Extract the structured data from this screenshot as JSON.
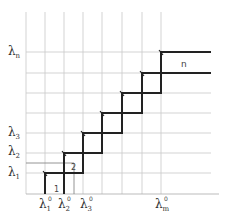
{
  "diagram": {
    "type": "staircase-grid",
    "grid": {
      "vertical_x": [
        26,
        45,
        64,
        83,
        102,
        122,
        142,
        161
      ],
      "horizontal_y": [
        52,
        73,
        93,
        113,
        133,
        153,
        173,
        193
      ],
      "top": 12,
      "bottom": 194,
      "left": 26,
      "right": 211,
      "color": "#c8c8c8"
    },
    "y_labels": [
      {
        "base": "λ",
        "sub": "1",
        "y": 173
      },
      {
        "base": "λ",
        "sub": "2",
        "y": 153
      },
      {
        "base": "λ",
        "sub": "3",
        "y": 133
      },
      {
        "base": "λ",
        "sub": "n",
        "y": 52
      }
    ],
    "x_labels": [
      {
        "base": "λ",
        "sup": "0",
        "sub": "1",
        "x": 45
      },
      {
        "base": "λ",
        "sup": "0",
        "sub": "2",
        "x": 64
      },
      {
        "base": "λ",
        "sup": "0",
        "sub": "3",
        "x": 83
      },
      {
        "base": "λ",
        "sup": "0",
        "sub": "m",
        "x": 161
      }
    ],
    "region_labels": [
      {
        "text": "1",
        "x": 54,
        "y": 186
      },
      {
        "text": "2",
        "x": 71,
        "y": 166
      },
      {
        "text": "n",
        "x": 181,
        "y": 62
      }
    ],
    "stroke_color": "#222222"
  }
}
